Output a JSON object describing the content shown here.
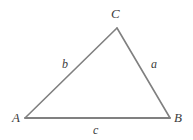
{
  "figure": {
    "kind": "triangle-diagram",
    "width": 193,
    "height": 140,
    "background_color": "#ffffff",
    "stroke_color": "#808080",
    "stroke_width": 1.6,
    "label_color": "#3c3c3c",
    "vertices": [
      {
        "name": "A",
        "label": "A",
        "x": 25,
        "y": 118
      },
      {
        "name": "B",
        "label": "B",
        "x": 170,
        "y": 118
      },
      {
        "name": "C",
        "label": "C",
        "x": 117,
        "y": 28
      }
    ],
    "sides": [
      {
        "name": "a",
        "label": "a",
        "between": "C-B",
        "label_x": 153,
        "label_y": 63
      },
      {
        "name": "b",
        "label": "b",
        "between": "A-C",
        "label_x": 65,
        "label_y": 63
      },
      {
        "name": "c",
        "label": "c",
        "between": "A-B",
        "label_x": 95,
        "label_y": 129
      }
    ],
    "path": "M 25 118 L 117 28 L 170 118 Z"
  },
  "chart_data": {
    "type": "diagram",
    "title": "",
    "shape": "triangle",
    "points": [
      {
        "label": "A",
        "x": 25,
        "y": 118
      },
      {
        "label": "C",
        "x": 117,
        "y": 28
      },
      {
        "label": "B",
        "x": 170,
        "y": 118
      }
    ],
    "edge_labels": [
      "a",
      "b",
      "c"
    ],
    "vertex_labels": [
      "A",
      "B",
      "C"
    ]
  }
}
